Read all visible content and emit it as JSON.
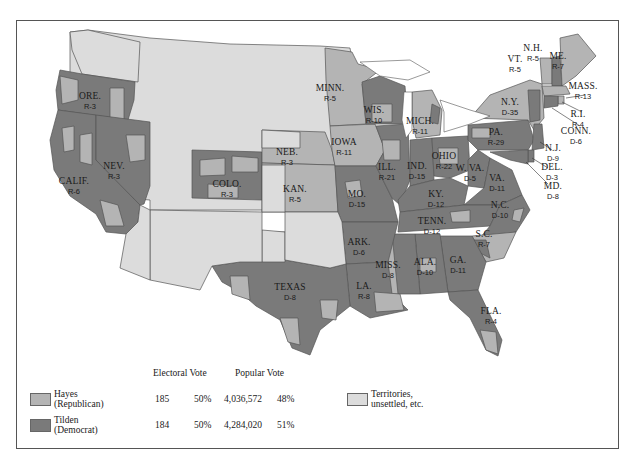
{
  "colors": {
    "republican": "#b4b4b4",
    "democrat": "#7a7a7a",
    "territories": "#dcdcdc",
    "border": "#555555",
    "water": "#ffffff"
  },
  "legend": {
    "headers": {
      "electoral_vote": "Electoral Vote",
      "popular_vote": "Popular Vote"
    },
    "rows": [
      {
        "name": "Hayes",
        "party": "(Republican)",
        "electoral_votes": "185",
        "electoral_pct": "50%",
        "popular_votes": "4,036,572",
        "popular_pct": "48%"
      },
      {
        "name": "Tilden",
        "party": "(Democrat)",
        "electoral_votes": "184",
        "electoral_pct": "50%",
        "popular_votes": "4,284,020",
        "popular_pct": "51%"
      }
    ],
    "territories": {
      "line1": "Territories,",
      "line2": "unsettled, etc."
    }
  },
  "states": [
    {
      "name": "ORE.",
      "vote": "R-3"
    },
    {
      "name": "CALIF.",
      "vote": "R-6"
    },
    {
      "name": "NEV.",
      "vote": "R-3"
    },
    {
      "name": "COLO.",
      "vote": "R-3"
    },
    {
      "name": "NEB.",
      "vote": "R-3"
    },
    {
      "name": "KAN.",
      "vote": "R-5"
    },
    {
      "name": "TEXAS",
      "vote": "D-8"
    },
    {
      "name": "MINN.",
      "vote": "R-5"
    },
    {
      "name": "IOWA",
      "vote": "R-11"
    },
    {
      "name": "MO.",
      "vote": "D-15"
    },
    {
      "name": "ARK.",
      "vote": "D-6"
    },
    {
      "name": "LA.",
      "vote": "R-8"
    },
    {
      "name": "WIS.",
      "vote": "R-10"
    },
    {
      "name": "ILL.",
      "vote": "R-21"
    },
    {
      "name": "MICH.",
      "vote": "R-11"
    },
    {
      "name": "IND.",
      "vote": "D-15"
    },
    {
      "name": "OHIO",
      "vote": "R-22"
    },
    {
      "name": "KY.",
      "vote": "D-12"
    },
    {
      "name": "TENN.",
      "vote": "D-12"
    },
    {
      "name": "MISS.",
      "vote": "D-8"
    },
    {
      "name": "ALA.",
      "vote": "D-10"
    },
    {
      "name": "GA.",
      "vote": "D-11"
    },
    {
      "name": "FLA.",
      "vote": "R-4"
    },
    {
      "name": "S.C.",
      "vote": "R-7"
    },
    {
      "name": "N.C.",
      "vote": "D-10"
    },
    {
      "name": "VA.",
      "vote": "D-11"
    },
    {
      "name": "W. VA.",
      "vote": "D-5"
    },
    {
      "name": "PA.",
      "vote": "R-29"
    },
    {
      "name": "N.Y.",
      "vote": "D-35"
    },
    {
      "name": "VT.",
      "vote": "R-5"
    },
    {
      "name": "N.H.",
      "vote": "R-5"
    },
    {
      "name": "ME.",
      "vote": "R-7"
    },
    {
      "name": "MASS.",
      "vote": "R-13"
    },
    {
      "name": "R.I.",
      "vote": "R-4"
    },
    {
      "name": "CONN.",
      "vote": "D-6"
    },
    {
      "name": "N.J.",
      "vote": "D-9"
    },
    {
      "name": "DEL.",
      "vote": "D-3"
    },
    {
      "name": "MD.",
      "vote": "D-8"
    }
  ]
}
